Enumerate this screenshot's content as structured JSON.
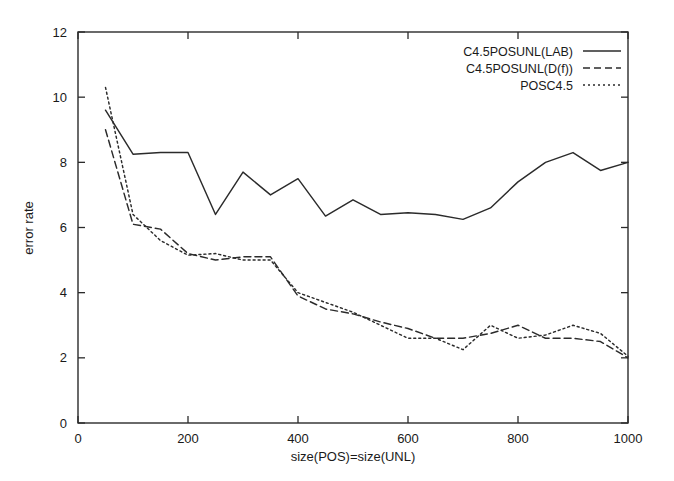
{
  "chart_data": {
    "type": "line",
    "title": "",
    "xlabel": "size(POS)=size(UNL)",
    "ylabel": "error rate",
    "xlim": [
      0,
      1000
    ],
    "ylim": [
      0,
      12
    ],
    "xticks": [
      0,
      200,
      400,
      600,
      800,
      1000
    ],
    "yticks": [
      0,
      2,
      4,
      6,
      8,
      10,
      12
    ],
    "xtick_labels": [
      "0",
      "200",
      "400",
      "600",
      "800",
      "1000"
    ],
    "ytick_labels": [
      "0",
      "2",
      "4",
      "6",
      "8",
      "10",
      "12"
    ],
    "grid": false,
    "legend_position": "top-right",
    "x": [
      50,
      100,
      150,
      200,
      250,
      300,
      350,
      400,
      450,
      500,
      550,
      600,
      650,
      700,
      750,
      800,
      850,
      900,
      950,
      1000
    ],
    "series": [
      {
        "name": "C4.5POSUNL(LAB)",
        "style": "solid",
        "values": [
          9.6,
          8.25,
          8.3,
          8.3,
          6.4,
          7.7,
          7.0,
          7.5,
          6.35,
          6.85,
          6.4,
          6.45,
          6.4,
          6.25,
          6.6,
          7.4,
          8.0,
          8.3,
          7.75,
          8.0
        ]
      },
      {
        "name": "C4.5POSUNL(D(f))",
        "style": "dashed",
        "values": [
          9.0,
          6.1,
          5.95,
          5.2,
          5.0,
          5.1,
          5.1,
          3.9,
          3.5,
          3.35,
          3.1,
          2.9,
          2.6,
          2.6,
          2.75,
          3.0,
          2.6,
          2.6,
          2.5,
          2.0
        ]
      },
      {
        "name": "POSC4.5",
        "style": "dotted",
        "values": [
          10.3,
          6.4,
          5.6,
          5.15,
          5.2,
          5.0,
          5.0,
          4.0,
          3.7,
          3.4,
          3.0,
          2.6,
          2.6,
          2.25,
          3.0,
          2.6,
          2.7,
          3.0,
          2.75,
          2.05
        ]
      }
    ]
  },
  "legend": {
    "entries": [
      {
        "label": "C4.5POSUNL(LAB)",
        "style": "solid"
      },
      {
        "label": "C4.5POSUNL(D(f))",
        "style": "dashed"
      },
      {
        "label": "POSC4.5",
        "style": "dotted"
      }
    ]
  }
}
